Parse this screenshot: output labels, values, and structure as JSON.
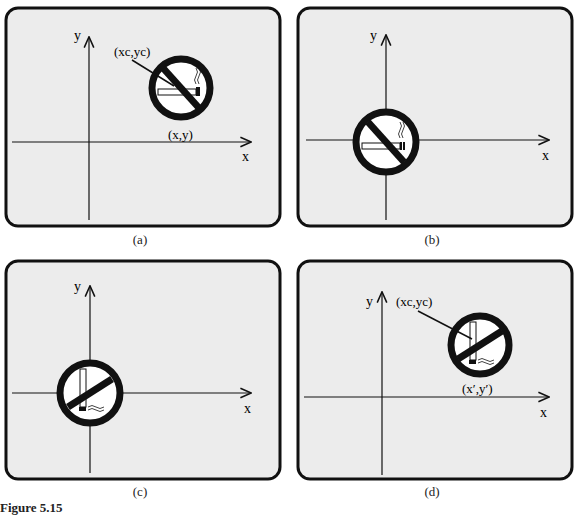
{
  "figure": {
    "caption": "Figure 5.15",
    "panels": [
      {
        "id": "a",
        "label": "(a)",
        "axis_x": "x",
        "axis_y": "y",
        "annotations": [
          "(xc,yc)",
          "(x,y)"
        ],
        "sign_rotation": "0"
      },
      {
        "id": "b",
        "label": "(b)",
        "axis_x": "x",
        "axis_y": "y",
        "annotations": [],
        "sign_rotation": "0"
      },
      {
        "id": "c",
        "label": "(c)",
        "axis_x": "x",
        "axis_y": "y",
        "annotations": [],
        "sign_rotation": "90"
      },
      {
        "id": "d",
        "label": "(d)",
        "axis_x": "x",
        "axis_y": "y",
        "annotations": [
          "(xc,yc)",
          "(x′,y′)"
        ],
        "sign_rotation": "90"
      }
    ]
  },
  "colors": {
    "panel_bg": "#ececec",
    "border": "#111111",
    "ink": "#111111"
  }
}
